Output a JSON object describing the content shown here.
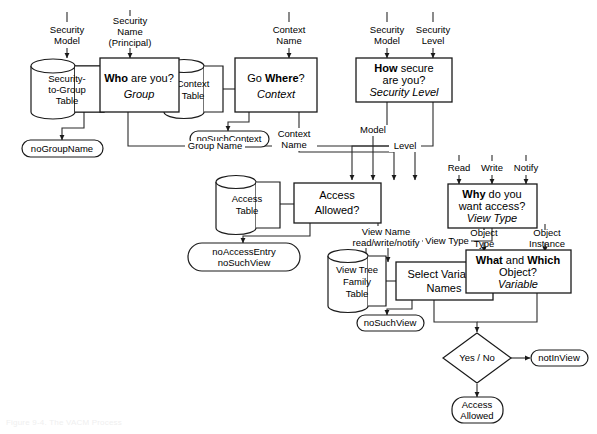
{
  "figure": {
    "caption": "Figure 9-4.  The VACM Process"
  },
  "colors": {
    "stroke": "#1a1a1a",
    "edge": "#2b2b2b",
    "fill": "#ffffff",
    "background": "#ffffff"
  },
  "inputs": [
    {
      "id": "in-security-model-1",
      "line1": "Security",
      "line2": "Model"
    },
    {
      "id": "in-security-name",
      "line1": "Security",
      "line2": "Name",
      "line3": "(Principal)"
    },
    {
      "id": "in-context-name",
      "line1": "Context",
      "line2": "Name"
    },
    {
      "id": "in-security-model-2",
      "line1": "Security",
      "line2": "Model"
    },
    {
      "id": "in-security-level",
      "line1": "Security",
      "line2": "Level"
    },
    {
      "id": "in-read",
      "line1": "Read"
    },
    {
      "id": "in-write",
      "line1": "Write"
    },
    {
      "id": "in-notify",
      "line1": "Notify"
    },
    {
      "id": "in-object-type",
      "line1": "Object",
      "line2": "Type"
    },
    {
      "id": "in-object-instance",
      "line1": "Object",
      "line2": "Instance"
    }
  ],
  "tables": [
    {
      "id": "tbl-security-to-group",
      "line1": "Security-",
      "line2": "to-Group",
      "line3": "Table"
    },
    {
      "id": "tbl-context",
      "line1": "Context",
      "line2": "Table"
    },
    {
      "id": "tbl-access",
      "line1": "Access",
      "line2": "Table"
    },
    {
      "id": "tbl-view-tree-family",
      "line1": "View Tree",
      "line2": "Family",
      "line3": "Table"
    }
  ],
  "processes": [
    {
      "id": "proc-who",
      "line1_bold": "Who",
      "line1_rest": " are you?",
      "line2_italic": "Group"
    },
    {
      "id": "proc-where",
      "line1_pre": "Go ",
      "line1_bold": "Where",
      "line1_rest": "?",
      "line2_italic": "Context"
    },
    {
      "id": "proc-how",
      "line1_bold": "How",
      "line1_rest": " secure",
      "line2": "are you?",
      "line3_italic": "Security Level"
    },
    {
      "id": "proc-why",
      "line1_bold": "Why",
      "line1_rest": " do you",
      "line2": "want access?",
      "line3_italic": "View Type"
    },
    {
      "id": "proc-access-allowed",
      "line1": "Access",
      "line2": "Allowed?"
    },
    {
      "id": "proc-select-variable-names",
      "line1": "Select Variable",
      "line2": "Names"
    },
    {
      "id": "proc-what-which",
      "line1_bold_a": "What",
      "line1_mid": " and ",
      "line1_bold_b": "Which",
      "line2": "Object?",
      "line3_italic": "Variable"
    }
  ],
  "errors": [
    {
      "id": "err-no-group-name",
      "line1": "noGroupName"
    },
    {
      "id": "err-no-such-context",
      "line1": "noSuchContext"
    },
    {
      "id": "err-no-access-entry",
      "line1": "noAccessEntry",
      "line2": "noSuchView"
    },
    {
      "id": "err-no-such-view",
      "line1": "noSuchView"
    },
    {
      "id": "err-not-in-view",
      "line1": "notInView"
    }
  ],
  "decision": {
    "id": "dec-yes-no",
    "label": "Yes / No"
  },
  "result": {
    "id": "res-access-allowed",
    "line1": "Access",
    "line2": "Allowed"
  },
  "edge_labels": [
    {
      "id": "lbl-group-name",
      "text": "Group Name"
    },
    {
      "id": "lbl-context-name",
      "line1": "Context",
      "line2": "Name"
    },
    {
      "id": "lbl-model",
      "text": "Model"
    },
    {
      "id": "lbl-level",
      "text": "Level"
    },
    {
      "id": "lbl-view-name",
      "line1": "View Name",
      "line2": "read/write/notify"
    },
    {
      "id": "lbl-view-type",
      "text": "View Type"
    }
  ]
}
